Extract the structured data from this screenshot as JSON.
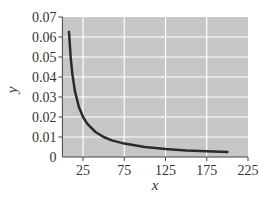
{
  "chart_data": {
    "type": "line",
    "title": "",
    "xlabel": "x",
    "ylabel": "y",
    "xlim": [
      0,
      225
    ],
    "ylim": [
      0,
      0.07
    ],
    "x_ticks": [
      25,
      75,
      125,
      175,
      225
    ],
    "x_tick_labels": [
      "25",
      "75",
      "125",
      "175",
      "225"
    ],
    "y_ticks": [
      0,
      0.01,
      0.02,
      0.03,
      0.04,
      0.05,
      0.06,
      0.07
    ],
    "y_tick_labels": [
      "0",
      "0.01",
      "0.02",
      "0.03",
      "0.04",
      "0.05",
      "0.06",
      "0.07"
    ],
    "grid": true,
    "legend": null,
    "series": [
      {
        "name": "y = 0.5/x",
        "x": [
          8,
          10,
          12,
          15,
          20,
          25,
          30,
          40,
          50,
          60,
          75,
          100,
          125,
          150,
          175,
          200
        ],
        "values": [
          0.0625,
          0.05,
          0.0417,
          0.0333,
          0.025,
          0.02,
          0.0167,
          0.0125,
          0.01,
          0.0083,
          0.0067,
          0.005,
          0.004,
          0.0033,
          0.0029,
          0.0025
        ]
      }
    ],
    "colors": {
      "plot_background": "#c6c6c6",
      "grid": "#ffffff",
      "line": "#2a2a2a",
      "axis": "#444444"
    }
  }
}
